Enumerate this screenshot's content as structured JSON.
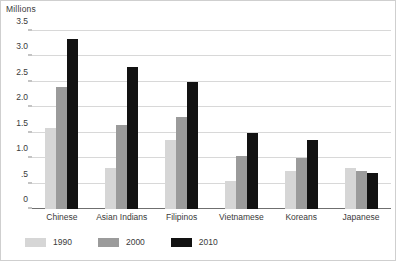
{
  "chart_data": {
    "type": "bar",
    "title": "",
    "subtitle": "",
    "xlabel": "",
    "ylabel": "Millions",
    "ylim": [
      0,
      3.5
    ],
    "ytick_labels": [
      "0",
      ".5",
      "1.0",
      "1.5",
      "2.0",
      "2.5",
      "3.0",
      "3.5"
    ],
    "ytick_values": [
      0,
      0.5,
      1.0,
      1.5,
      2.0,
      2.5,
      3.0,
      3.5
    ],
    "grid": true,
    "legend_position": "bottom-left",
    "categories": [
      "Chinese",
      "Asian Indians",
      "Filipinos",
      "Vietnamese",
      "Koreans",
      "Japanese"
    ],
    "series": [
      {
        "name": "1990",
        "color": "#d6d6d6",
        "values": [
          1.6,
          0.8,
          1.35,
          0.55,
          0.75,
          0.8
        ]
      },
      {
        "name": "2000",
        "color": "#9b9b9b",
        "values": [
          2.4,
          1.65,
          1.8,
          1.05,
          1.0,
          0.75
        ]
      },
      {
        "name": "2010",
        "color": "#121212",
        "values": [
          3.35,
          2.8,
          2.5,
          1.5,
          1.35,
          0.7
        ]
      }
    ]
  },
  "legend": {
    "items": [
      {
        "label": "1990"
      },
      {
        "label": "2000"
      },
      {
        "label": "2010"
      }
    ]
  }
}
